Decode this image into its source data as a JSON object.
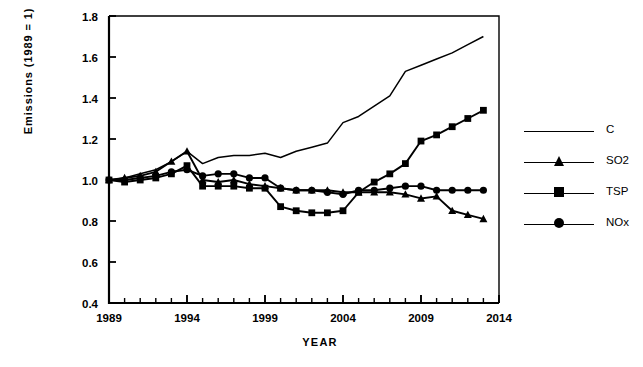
{
  "chart_data": {
    "type": "line",
    "title": "",
    "xlabel": "YEAR",
    "ylabel": "Emissions  (1989  =  1)",
    "xlim": [
      1989,
      2014
    ],
    "ylim": [
      0.4,
      1.8
    ],
    "xticks": [
      1989,
      1994,
      1999,
      2004,
      2009,
      2014
    ],
    "xtick_labels": [
      "1989",
      "1994",
      "1999",
      "2004",
      "2009",
      "2014"
    ],
    "yticks": [
      0.4,
      0.6,
      0.8,
      1.0,
      1.2,
      1.4,
      1.6,
      1.8
    ],
    "ytick_labels": [
      "0.4",
      "0.6",
      "0.8",
      "1.0",
      "1.2",
      "1.4",
      "1.6",
      "1.8"
    ],
    "minor_xtick_interval": 1,
    "grid": false,
    "legend_position": "right",
    "x": [
      1989,
      1990,
      1991,
      1992,
      1993,
      1994,
      1995,
      1996,
      1997,
      1998,
      1999,
      2000,
      2001,
      2002,
      2003,
      2004,
      2005,
      2006,
      2007,
      2008,
      2009,
      2010,
      2011,
      2012,
      2013
    ],
    "series": [
      {
        "name": "C",
        "marker": "none",
        "color": "#000000",
        "values": [
          1.0,
          1.01,
          1.03,
          1.05,
          1.09,
          1.14,
          1.08,
          1.11,
          1.12,
          1.12,
          1.13,
          1.11,
          1.14,
          1.16,
          1.18,
          1.28,
          1.31,
          1.36,
          1.41,
          1.53,
          1.56,
          1.59,
          1.62,
          1.66,
          1.7
        ]
      },
      {
        "name": "SO2",
        "marker": "triangle",
        "color": "#000000",
        "values": [
          1.0,
          1.01,
          1.02,
          1.04,
          1.09,
          1.14,
          1.0,
          0.99,
          1.0,
          0.98,
          0.97,
          0.96,
          0.95,
          0.95,
          0.95,
          0.94,
          0.94,
          0.94,
          0.94,
          0.93,
          0.91,
          0.92,
          0.85,
          0.83,
          0.81
        ]
      },
      {
        "name": "TSP",
        "marker": "square",
        "color": "#000000",
        "values": [
          1.0,
          0.99,
          1.0,
          1.01,
          1.03,
          1.07,
          0.97,
          0.97,
          0.97,
          0.96,
          0.96,
          0.87,
          0.85,
          0.84,
          0.84,
          0.85,
          0.94,
          0.99,
          1.03,
          1.08,
          1.19,
          1.22,
          1.26,
          1.3,
          1.34
        ]
      },
      {
        "name": "NOx",
        "marker": "circle",
        "color": "#000000",
        "values": [
          1.0,
          1.0,
          1.01,
          1.02,
          1.04,
          1.05,
          1.02,
          1.03,
          1.03,
          1.01,
          1.01,
          0.96,
          0.95,
          0.95,
          0.94,
          0.93,
          0.95,
          0.95,
          0.96,
          0.97,
          0.97,
          0.95,
          0.95,
          0.95,
          0.95
        ]
      }
    ],
    "extra_points": {
      "note_tsp_final": 1.38
    }
  },
  "legend": {
    "entries": [
      {
        "label": "C",
        "marker": "line-swatch"
      },
      {
        "label": "SO2",
        "marker": "triangle-marker"
      },
      {
        "label": "TSP",
        "marker": "square-marker"
      },
      {
        "label": "NOx",
        "marker": "circle-marker"
      }
    ]
  }
}
